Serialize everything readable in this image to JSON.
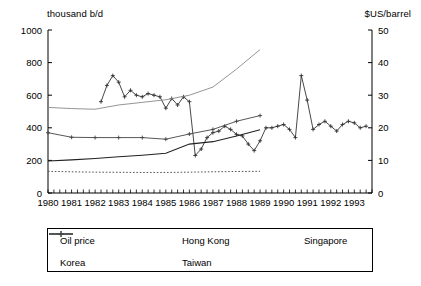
{
  "chart_data": {
    "type": "line",
    "title": "",
    "xlabel": "",
    "ylabel": "thousand b/d",
    "y2label": "$US/barrel",
    "xlim": [
      1980,
      1993.75
    ],
    "ylim": [
      0,
      1000
    ],
    "y2lim": [
      0,
      50
    ],
    "grid": false,
    "legend_position": "bottom",
    "yticks": [
      0,
      200,
      400,
      600,
      800,
      1000
    ],
    "y2ticks": [
      0,
      10,
      20,
      30,
      40,
      50
    ],
    "xticks": [
      1980,
      1981,
      1982,
      1983,
      1984,
      1985,
      1986,
      1987,
      1988,
      1989,
      1990,
      1991,
      1992,
      1993
    ],
    "xtick_labels": [
      "1980",
      "1981",
      "1982",
      "1983",
      "1984",
      "1985",
      "1986",
      "1987",
      "1988",
      "1989",
      "1990",
      "1991",
      "1992",
      "1993"
    ],
    "minor_xtick_interval": 0.25,
    "series": [
      {
        "name": "Oil price",
        "axis": "right",
        "style": "line-marker",
        "marker": "plus",
        "color": "#333333",
        "x": [
          1982.25,
          1982.5,
          1982.75,
          1983.0,
          1983.25,
          1983.5,
          1983.75,
          1984.0,
          1984.25,
          1984.5,
          1984.75,
          1985.0,
          1985.25,
          1985.5,
          1985.75,
          1986.0,
          1986.25,
          1986.5,
          1986.75,
          1987.0,
          1987.25,
          1987.5,
          1987.75,
          1988.0,
          1988.25,
          1988.5,
          1988.75,
          1989.0,
          1989.25,
          1989.5,
          1989.75,
          1990.0,
          1990.25,
          1990.5,
          1990.75,
          1991.0,
          1991.25,
          1991.5,
          1991.75,
          1992.0,
          1992.25,
          1992.5,
          1992.75,
          1993.0,
          1993.25,
          1993.5
        ],
        "values": [
          28.0,
          33.0,
          36.0,
          34.0,
          29.5,
          31.5,
          30.0,
          29.5,
          30.5,
          30.0,
          29.5,
          26.0,
          29.0,
          27.0,
          29.5,
          28.0,
          11.5,
          13.5,
          17.0,
          18.5,
          19.0,
          20.5,
          19.5,
          18.0,
          17.5,
          15.0,
          13.0,
          16.0,
          20.0,
          20.0,
          20.5,
          21.0,
          19.5,
          17.0,
          36.0,
          28.5,
          19.5,
          21.0,
          22.0,
          20.5,
          19.0,
          21.0,
          22.0,
          21.5,
          20.0,
          20.5
        ]
      },
      {
        "name": "Hong Kong",
        "axis": "left",
        "style": "dotted",
        "color": "#555555",
        "x": [
          1980,
          1981,
          1982,
          1983,
          1984,
          1985,
          1986,
          1987,
          1988,
          1989
        ],
        "values": [
          133,
          130,
          128,
          127,
          126,
          126,
          128,
          130,
          132,
          133
        ]
      },
      {
        "name": "Singapore",
        "axis": "left",
        "style": "solid",
        "color": "#222222",
        "x": [
          1980,
          1981,
          1982,
          1983,
          1984,
          1985,
          1986,
          1987,
          1988,
          1989
        ],
        "values": [
          196,
          203,
          212,
          222,
          232,
          244,
          300,
          315,
          350,
          388
        ]
      },
      {
        "name": "Korea",
        "axis": "left",
        "style": "solid-light",
        "color": "#888888",
        "x": [
          1980,
          1981,
          1982,
          1983,
          1984,
          1985,
          1986,
          1987,
          1988,
          1989
        ],
        "values": [
          525,
          518,
          514,
          540,
          556,
          572,
          600,
          650,
          760,
          880
        ]
      },
      {
        "name": "Taiwan",
        "axis": "left",
        "style": "line-marker",
        "marker": "plus",
        "color": "#444444",
        "x": [
          1980,
          1981,
          1982,
          1983,
          1984,
          1985,
          1986,
          1987,
          1988,
          1989
        ],
        "values": [
          370,
          342,
          340,
          340,
          340,
          330,
          362,
          390,
          440,
          475
        ]
      }
    ]
  },
  "axes": {
    "left_unit": "thousand b/d",
    "right_unit": "$US/barrel"
  },
  "legend": {
    "items": [
      {
        "label": "Oil price",
        "icon": "line-plus-marker-icon"
      },
      {
        "label": "Hong Kong",
        "icon": "dotted-line-icon"
      },
      {
        "label": "Singapore",
        "icon": "solid-line-icon"
      },
      {
        "label": "Korea",
        "icon": "light-line-icon"
      },
      {
        "label": "Taiwan",
        "icon": "line-plus-marker-icon"
      }
    ]
  }
}
